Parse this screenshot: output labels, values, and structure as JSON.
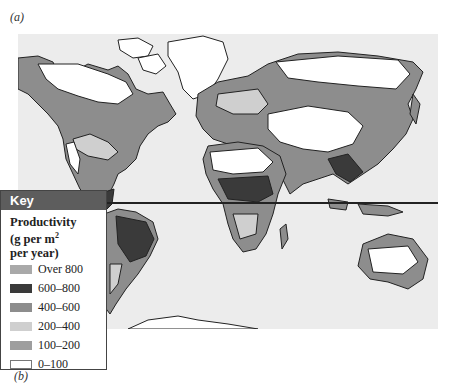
{
  "figure": {
    "panel_label_a": "(a)",
    "panel_label_b": "(b)"
  },
  "map": {
    "ocean_color": "#ececec",
    "outline_color": "#222222",
    "equator_visible": true
  },
  "key": {
    "header": "Key",
    "title_line1": "Productivity",
    "title_line2_prefix": "(g per m",
    "title_line2_sup": "2",
    "title_line3": "per year)",
    "items": [
      {
        "label": "Over 800",
        "color": "#a9a9a9"
      },
      {
        "label": "600–800",
        "color": "#3a3a3a"
      },
      {
        "label": "400–600",
        "color": "#8d8d8d"
      },
      {
        "label": "200–400",
        "color": "#cfcfcf"
      },
      {
        "label": "100–200",
        "color": "#9e9e9e"
      },
      {
        "label": "0–100",
        "color": "#ffffff"
      }
    ]
  }
}
